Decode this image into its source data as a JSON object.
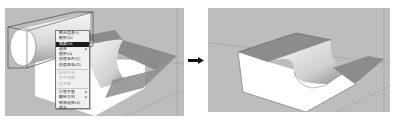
{
  "figure": {
    "left_caption": "",
    "right_caption": "",
    "arrow": "right-arrow"
  },
  "context_menu": {
    "items": [
      {
        "label": "图元信息(I)",
        "state": "normal"
      },
      {
        "label": "删除(D)",
        "state": "normal"
      },
      {
        "label": "隐藏(H)",
        "state": "highlighted"
      },
      {
        "label": "选择",
        "state": "normal",
        "submenu": "▸"
      },
      {
        "label": "面积(A)",
        "state": "normal"
      },
      {
        "label": "创建组件(C)",
        "state": "normal"
      },
      {
        "label": "创建群组(G)",
        "state": "normal"
      },
      {
        "label": "反转方向",
        "state": "disabled"
      },
      {
        "label": "对齐视图",
        "state": "disabled"
      },
      {
        "label": "对齐轴",
        "state": "disabled"
      },
      {
        "label": "交错平面",
        "state": "normal",
        "submenu": "▸"
      },
      {
        "label": "翻转方向",
        "state": "normal",
        "submenu": "▸"
      },
      {
        "label": "缩放选择(Z)",
        "state": "normal"
      },
      {
        "label": "简化",
        "state": "normal"
      }
    ]
  },
  "colors": {
    "background": "#bdbdbd",
    "top_face": "#8c8c8c",
    "front_face": "#ffffff",
    "menu_highlight": "#1a1a1a"
  }
}
